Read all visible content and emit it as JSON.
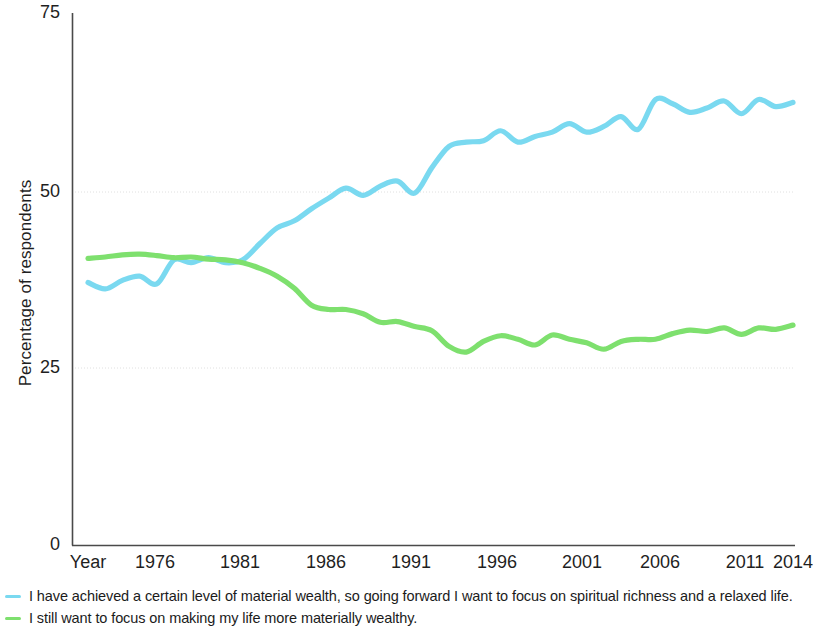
{
  "chart_data": {
    "type": "line",
    "title": "",
    "xlabel": "Year",
    "ylabel": "Percentage of respondents",
    "ylim": [
      0,
      75
    ],
    "yticks": [
      0,
      25,
      50,
      75
    ],
    "xlim": [
      1973,
      2014
    ],
    "xticks": [
      1976,
      1981,
      1986,
      1991,
      1996,
      2001,
      2006,
      2011,
      2014
    ],
    "grid": "horizontal-faint",
    "legend_position": "below",
    "x": [
      1973,
      1974,
      1975,
      1976,
      1977,
      1978,
      1979,
      1980,
      1981,
      1982,
      1983,
      1984,
      1985,
      1986,
      1987,
      1988,
      1989,
      1990,
      1991,
      1992,
      1993,
      1994,
      1995,
      1996,
      1997,
      1998,
      1999,
      2000,
      2001,
      2002,
      2003,
      2004,
      2005,
      2006,
      2007,
      2008,
      2009,
      2010,
      2011,
      2012,
      2013,
      2014
    ],
    "series": [
      {
        "name": "I have achieved a certain level of material wealth, so going forward I want to focus on spiritual richness and a relaxed life.",
        "color": "#7ad9f0",
        "values": [
          37.0,
          36.1,
          37.3,
          37.9,
          36.8,
          40.2,
          39.8,
          40.5,
          39.8,
          40.2,
          42.5,
          44.7,
          45.7,
          47.4,
          48.9,
          50.3,
          49.3,
          50.6,
          51.3,
          49.6,
          53.2,
          56.2,
          56.8,
          57.0,
          58.4,
          56.8,
          57.6,
          58.2,
          59.4,
          58.2,
          59.0,
          60.4,
          58.6,
          62.8,
          62.2,
          61.0,
          61.6,
          62.6,
          60.8,
          62.8,
          61.8,
          62.4
        ]
      },
      {
        "name": "I still want to focus on making my life more materially wealthy.",
        "color": "#7ee06e",
        "values": [
          40.4,
          40.6,
          40.9,
          41.0,
          40.8,
          40.5,
          40.6,
          40.3,
          40.2,
          39.8,
          39.0,
          37.9,
          36.2,
          33.8,
          33.2,
          33.2,
          32.6,
          31.4,
          31.5,
          30.8,
          30.2,
          28.0,
          27.2,
          28.7,
          29.5,
          29.0,
          28.2,
          29.6,
          29.0,
          28.5,
          27.6,
          28.7,
          29.0,
          29.0,
          29.8,
          30.3,
          30.1,
          30.6,
          29.7,
          30.6,
          30.4,
          31.0
        ]
      }
    ]
  },
  "axis": {
    "ylabel": "Percentage of respondents",
    "ytick_labels": [
      "75",
      "50",
      "25",
      "0"
    ],
    "xaxis_title": "Year",
    "xtick_labels": [
      "1976",
      "1981",
      "1986",
      "1991",
      "1996",
      "2001",
      "2006",
      "2011",
      "2014"
    ]
  },
  "legend": {
    "items": [
      {
        "label": "I have achieved a certain level of material wealth, so going forward I want to focus on spiritual richness and a relaxed life.",
        "color": "#7ad9f0"
      },
      {
        "label": "I still want to focus on making my life more materially wealthy.",
        "color": "#7ee06e"
      }
    ]
  }
}
